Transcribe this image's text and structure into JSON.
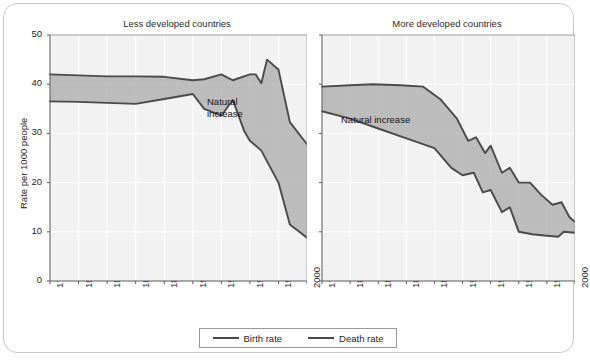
{
  "figure": {
    "y_axis_label": "Rate per 1000 people",
    "annotation_label_left": "Natural\nincrease",
    "annotation_label_right": "Natural increase"
  },
  "legend": {
    "items": [
      {
        "label": "Birth rate",
        "color": "#4a4a4a"
      },
      {
        "label": "Death rate",
        "color": "#4a4a4a"
      }
    ]
  },
  "chart_data": [
    {
      "type": "area",
      "title": "Less developed countries",
      "xlabel": "",
      "ylabel": "Rate per 1000 people",
      "xlim": [
        1775,
        2000
      ],
      "ylim": [
        0,
        50
      ],
      "yticks": [
        0,
        10,
        20,
        30,
        40,
        50
      ],
      "xticks": [
        1775,
        1800,
        1825,
        1850,
        1875,
        1900,
        1925,
        1950,
        1975,
        2000
      ],
      "grid": true,
      "legend_position": "bottom-outside",
      "fill_label": "Natural increase",
      "fill_color": "#b3b3b3",
      "series": [
        {
          "name": "Birth rate",
          "color": "#4a4a4a",
          "x": [
            1775,
            1800,
            1825,
            1850,
            1875,
            1900,
            1910,
            1925,
            1935,
            1950,
            1955,
            1960,
            1965,
            1975,
            1985,
            2000
          ],
          "values": [
            42.0,
            41.8,
            41.6,
            41.6,
            41.5,
            40.8,
            41.0,
            42.0,
            40.8,
            42.0,
            42.0,
            40.2,
            45.0,
            43.0,
            32.3,
            27.8
          ]
        },
        {
          "name": "Death rate",
          "color": "#4a4a4a",
          "x": [
            1775,
            1800,
            1825,
            1850,
            1875,
            1900,
            1910,
            1925,
            1935,
            1945,
            1950,
            1960,
            1975,
            1985,
            2000
          ],
          "values": [
            36.5,
            36.4,
            36.2,
            36.0,
            37.0,
            38.0,
            35.0,
            33.6,
            36.8,
            30.5,
            28.5,
            26.5,
            20.0,
            11.5,
            8.8
          ]
        }
      ]
    },
    {
      "type": "area",
      "title": "More developed countries",
      "xlabel": "",
      "ylabel": "",
      "xlim": [
        1775,
        2000
      ],
      "ylim": [
        0,
        50
      ],
      "yticks": [
        0,
        10,
        20,
        30,
        40,
        50
      ],
      "xticks": [
        1775,
        1800,
        1825,
        1850,
        1875,
        1900,
        1925,
        1950,
        1975,
        2000
      ],
      "grid": true,
      "fill_label": "Natural increase",
      "fill_color": "#b3b3b3",
      "series": [
        {
          "name": "Birth rate",
          "color": "#4a4a4a",
          "x": [
            1775,
            1800,
            1820,
            1845,
            1865,
            1880,
            1895,
            1905,
            1912,
            1920,
            1925,
            1935,
            1942,
            1950,
            1960,
            1970,
            1980,
            1988,
            1995,
            2000
          ],
          "values": [
            39.5,
            39.8,
            40.0,
            39.8,
            39.5,
            37.0,
            33.0,
            28.5,
            29.2,
            26.0,
            27.5,
            22.0,
            23.0,
            20.0,
            20.0,
            17.5,
            15.5,
            16.0,
            13.0,
            12.0
          ]
        },
        {
          "name": "Death rate",
          "color": "#4a4a4a",
          "x": [
            1775,
            1800,
            1825,
            1850,
            1875,
            1890,
            1900,
            1910,
            1918,
            1925,
            1935,
            1942,
            1950,
            1962,
            1975,
            1985,
            1990,
            2000
          ],
          "values": [
            34.5,
            33.0,
            31.0,
            29.0,
            27.0,
            23.0,
            21.5,
            22.0,
            18.0,
            18.5,
            14.0,
            15.0,
            10.0,
            9.5,
            9.2,
            9.0,
            10.0,
            9.8
          ]
        }
      ]
    }
  ]
}
